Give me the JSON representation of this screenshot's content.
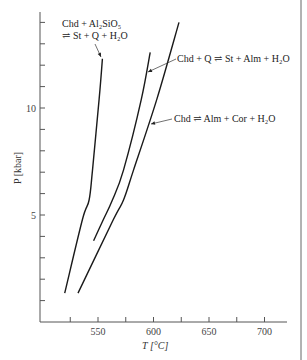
{
  "chart_data": {
    "type": "line",
    "title": "",
    "xlabel": "T [°C]",
    "ylabel": "P [kbar]",
    "xlim": [
      505,
      720
    ],
    "ylim": [
      0,
      14.5
    ],
    "x_ticks": [
      525,
      550,
      575,
      600,
      625,
      650,
      675,
      700
    ],
    "x_tick_labels": [
      "",
      "550",
      "",
      "600",
      "",
      "650",
      "",
      "700"
    ],
    "y_ticks": [
      1,
      2,
      3,
      4,
      5,
      6,
      7,
      8,
      9,
      10,
      11,
      12,
      13,
      14
    ],
    "y_tick_labels": [
      "",
      "",
      "",
      "",
      "5",
      "",
      "",
      "",
      "",
      "10",
      "",
      "",
      "",
      ""
    ],
    "grid": false,
    "legend": "none (curves labelled directly)",
    "series": [
      {
        "name": "Chd + Al2SiO5 ⇌ St + Q + H2O",
        "x": [
          520,
          536,
          542,
          545,
          551,
          554
        ],
        "y": [
          1.35,
          4.8,
          5.7,
          7.1,
          10.4,
          12.3
        ]
      },
      {
        "name": "Chd + Q ⇌ St + Alm + H2O",
        "x": [
          546,
          555,
          563,
          573,
          589,
          597
        ],
        "y": [
          3.8,
          4.8,
          5.7,
          7.1,
          10.4,
          12.6
        ]
      },
      {
        "name": "Chd ⇌ Alm + Cor + H2O",
        "x": [
          532,
          564,
          573,
          582,
          603,
          623
        ],
        "y": [
          1.35,
          4.8,
          5.7,
          7.1,
          10.4,
          14.0
        ]
      }
    ],
    "annotations": [
      {
        "text_line1": "Chd + Al₂SiO₅",
        "text_line2": "⇌ St + Q + H₂O",
        "points_to_series": 0
      },
      {
        "text": "Chd + Q ⇌ St + Alm + H₂O",
        "points_to_series": 1
      },
      {
        "text": "Chd ⇌ Alm + Cor + H₂O",
        "points_to_series": 2
      }
    ]
  },
  "labels": {
    "x_axis": "T [°C]",
    "y_axis": "P  [kbar]",
    "note1_line1": "Chd + Al₂SiO₅",
    "note1_line2": "⇌ St + Q + H₂O",
    "note2": "Chd + Q ⇌ St + Alm + H₂O",
    "note3": "Chd ⇌ Alm + Cor + H₂O"
  }
}
